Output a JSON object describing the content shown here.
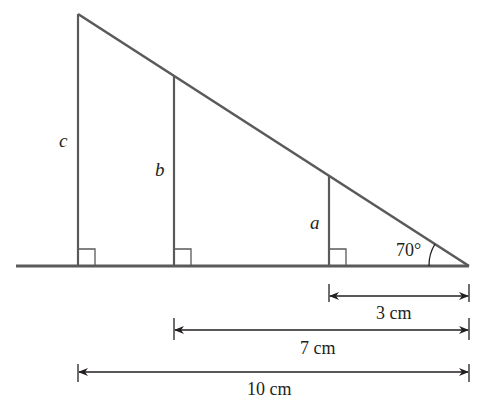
{
  "diagram": {
    "type": "similar right triangles",
    "labels": {
      "c": "c",
      "b": "b",
      "a": "a",
      "angle": "70°"
    },
    "dimensions": [
      {
        "id": "d3",
        "label": "3 cm"
      },
      {
        "id": "d7",
        "label": "7 cm"
      },
      {
        "id": "d10",
        "label": "10 cm"
      }
    ],
    "colors": {
      "line": "#5a5a5a",
      "text": "#231f20",
      "background": "#ffffff"
    }
  }
}
